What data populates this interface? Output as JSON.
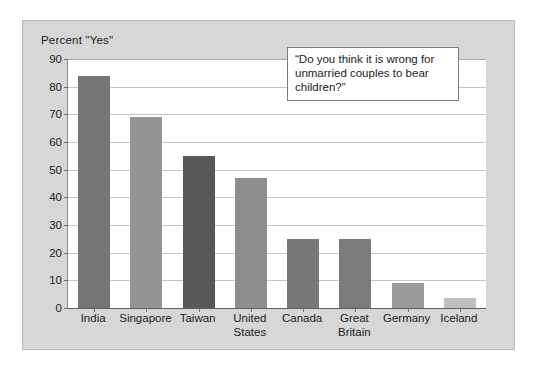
{
  "figure": {
    "axis_title": "Percent \"Yes\"",
    "annotation": "“Do you think it is wrong for unmarried couples to bear children?”",
    "frame_color": "#d7d7d7",
    "plot_background": "#ffffff",
    "gridline_color": "#c5c5c5"
  },
  "chart_data": {
    "type": "bar",
    "title": "",
    "subtitle": "",
    "xlabel": "",
    "ylabel": "Percent \"Yes\"",
    "ylim": [
      0,
      90
    ],
    "ytick_step": 10,
    "yticks": [
      0,
      10,
      20,
      30,
      40,
      50,
      60,
      70,
      80,
      90
    ],
    "ytick_labels": [
      "0",
      "10",
      "20",
      "30",
      "40",
      "50",
      "60",
      "70",
      "80",
      "90"
    ],
    "grid": true,
    "legend": false,
    "legend_position": "none",
    "categories": [
      "India",
      "Singapore",
      "Taiwan",
      "United States",
      "Canada",
      "Great Britain",
      "Germany",
      "Iceland"
    ],
    "category_label_lines": [
      [
        "India"
      ],
      [
        "Singapore"
      ],
      [
        "Taiwan"
      ],
      [
        "United",
        "States"
      ],
      [
        "Canada"
      ],
      [
        "Great",
        "Britain"
      ],
      [
        "Germany"
      ],
      [
        "Iceland"
      ]
    ],
    "values": [
      84,
      69,
      55,
      47,
      25,
      25,
      9,
      3.5
    ],
    "bar_colors": [
      "#757575",
      "#949494",
      "#585858",
      "#8e8e8e",
      "#787878",
      "#7b7b7b",
      "#9a9a9a",
      "#bfbfbf"
    ],
    "annotations": [
      {
        "text": "“Do you think it is wrong for unmarried couples to bear children?”"
      }
    ]
  }
}
